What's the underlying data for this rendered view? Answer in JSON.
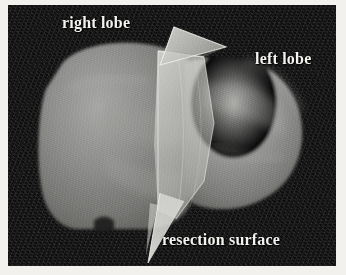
{
  "figure": {
    "kind": "3d-medical-rendering",
    "background_color": "#0d0d0d",
    "page_color": "#f2f1ee",
    "label_color": "#f4f3ef",
    "tissue_color": "#8f8f8f",
    "plane_color": "#cfcfcf"
  },
  "annotations": {
    "right_lobe": "right lobe",
    "left_lobe": "left lobe",
    "resection_surface": "resection surface"
  },
  "structures": {
    "liver_label": "liver volume",
    "resection_plane_label": "resection plane",
    "wing_label": "resection plane wing"
  }
}
